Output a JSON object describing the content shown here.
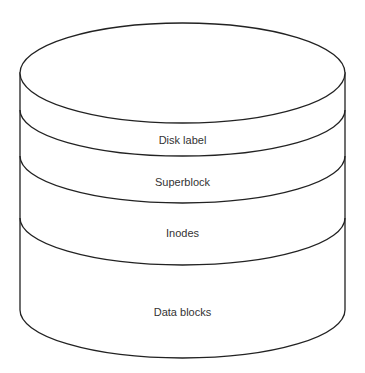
{
  "diagram": {
    "type": "disk-layout-cylinder",
    "layers": [
      {
        "label": "Disk label"
      },
      {
        "label": "Superblock"
      },
      {
        "label": "Inodes"
      },
      {
        "label": "Data blocks"
      }
    ],
    "colors": {
      "stroke": "#222222",
      "fill": "#ffffff",
      "text": "#333333"
    }
  }
}
